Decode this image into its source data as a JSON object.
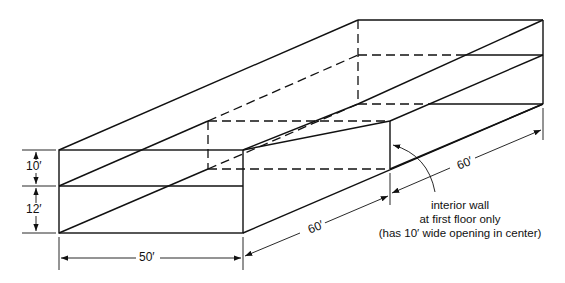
{
  "diagram": {
    "type": "isometric building section",
    "dimensions": {
      "height_upper": "10′",
      "height_lower": "12′",
      "width": "50′",
      "depth_front": "60′",
      "depth_back": "60′"
    },
    "annotation": {
      "line1": "interior wall",
      "line2": "at first floor only",
      "line3": "(has 10′ wide opening in center)"
    }
  }
}
